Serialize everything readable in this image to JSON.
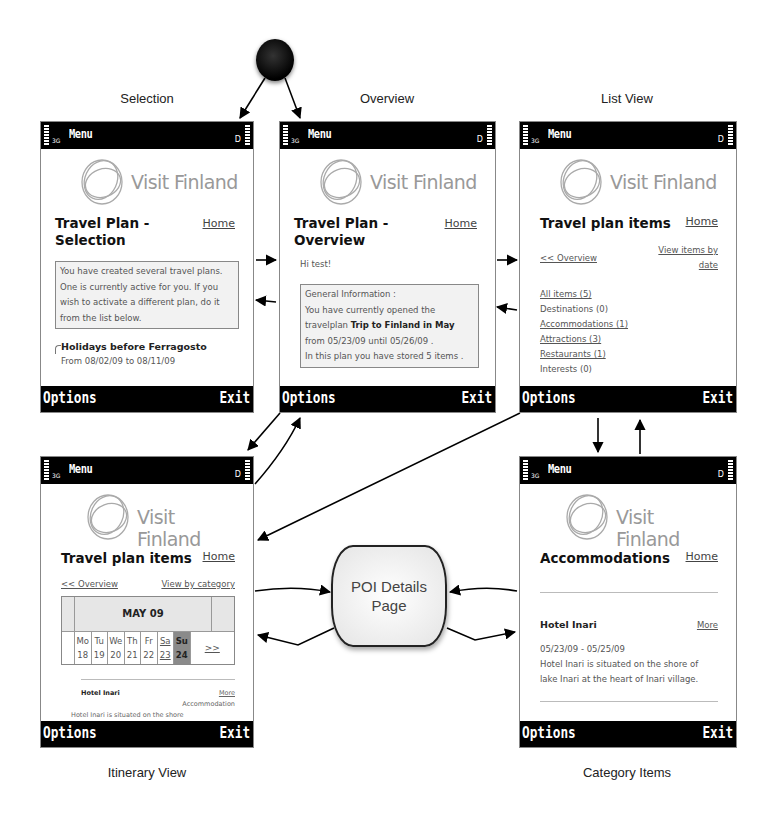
{
  "diagram": {
    "captions": {
      "selection": "Selection",
      "overview": "Overview",
      "list_view": "List View",
      "itinerary_view": "Itinerary View",
      "category_items": "Category Items"
    },
    "poi_node": "POI Details\nPage",
    "start_node": "start"
  },
  "phone_chrome": {
    "menu_label": "Menu",
    "network": "3G",
    "battery": "D",
    "options": "Options",
    "exit": "Exit",
    "brand": "Visit Finland",
    "home": "Home"
  },
  "screens": {
    "selection": {
      "title": "Travel Plan - Selection",
      "info": "You have created several travel plans. One is currently active for you. If you wish to activate a different plan, do it from the list below.",
      "plan_name": "Holidays before Ferragosto",
      "plan_dates": "From 08/02/09 to 08/11/09"
    },
    "overview": {
      "title": "Travel Plan - Overview",
      "greeting": "Hi test!",
      "info_heading": "General Information :",
      "info_line1": "You have currently opened the",
      "info_line2_pre": "travelplan ",
      "info_plan": "Trip to Finland in May",
      "info_line3": "from 05/23/09 until 05/26/09 .",
      "info_line4": "In this plan you have stored 5 items ."
    },
    "list_view": {
      "title": "Travel plan items",
      "back_link": "<< Overview",
      "alt_link": "View items by date",
      "categories": [
        {
          "label": "All items (5)",
          "link": true
        },
        {
          "label": "Destinations (0)",
          "link": false
        },
        {
          "label": "Accommodations (1)",
          "link": true
        },
        {
          "label": "Attractions (3)",
          "link": true
        },
        {
          "label": "Restaurants (1)",
          "link": true
        },
        {
          "label": "Interests (0)",
          "link": false
        }
      ]
    },
    "itinerary": {
      "title": "Travel plan items",
      "back_link": "<< Overview",
      "alt_link": "View by category",
      "month": "MAY 09",
      "days": [
        {
          "dow": "Mo",
          "date": "18"
        },
        {
          "dow": "Tu",
          "date": "19"
        },
        {
          "dow": "We",
          "date": "20"
        },
        {
          "dow": "Th",
          "date": "21"
        },
        {
          "dow": "Fr",
          "date": "22"
        },
        {
          "dow": "Sa",
          "date": "23"
        },
        {
          "dow": "Su",
          "date": "24"
        }
      ],
      "next": ">>",
      "item_name": "Hotel Inari",
      "item_more": "More",
      "item_type": "Accommodation",
      "item_desc": "Hotel Inari is situated on the shore"
    },
    "category": {
      "title": "Accommodations",
      "item_name": "Hotel Inari",
      "item_more": "More",
      "item_dates": "05/23/09 - 05/25/09",
      "item_desc": "Hotel Inari is situated on the shore of lake Inari at the heart of Inari village."
    }
  }
}
